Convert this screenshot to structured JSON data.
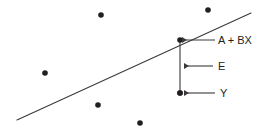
{
  "figure": {
    "type": "regression-scatter-diagram",
    "background_color": "#ffffff",
    "ink_color": "#3a3a3a",
    "text_color": "#231f20",
    "width": 273,
    "height": 132
  },
  "labels": {
    "fitted_line": "A + BX",
    "residual": "E",
    "observed": "Y"
  },
  "chart_data": {
    "type": "scatter",
    "title": "",
    "xlabel": "",
    "ylabel": "",
    "xlim": [
      0,
      273
    ],
    "ylim": [
      0,
      132
    ],
    "grid": false,
    "legend": "none",
    "points": [
      {
        "x": 101,
        "y": 15
      },
      {
        "x": 208,
        "y": 10
      },
      {
        "x": 45,
        "y": 73
      },
      {
        "x": 98,
        "y": 105
      },
      {
        "x": 140,
        "y": 123
      },
      {
        "x": 180,
        "y": 93
      }
    ],
    "point_radius": 2.8,
    "regression_line": {
      "x1": 17,
      "y1": 120,
      "x2": 251,
      "y2": 13,
      "label": "A + BX"
    },
    "fitted_point": {
      "x": 180,
      "y": 40
    },
    "observed_point": {
      "x": 180,
      "y": 93
    },
    "residual_segment": {
      "x": 180,
      "y_top": 40,
      "y_bottom": 93
    },
    "annotations": [
      {
        "label": "A + BX",
        "arrow_from_x": 215,
        "arrow_to_x": 182,
        "y": 40,
        "text_x": 218,
        "text_y": 44
      },
      {
        "label": "E",
        "arrow_from_x": 213,
        "arrow_to_x": 184,
        "y": 66,
        "text_x": 218,
        "text_y": 70
      },
      {
        "label": "Y",
        "arrow_from_x": 215,
        "arrow_to_x": 184,
        "y": 93,
        "text_x": 220,
        "text_y": 97
      }
    ]
  }
}
